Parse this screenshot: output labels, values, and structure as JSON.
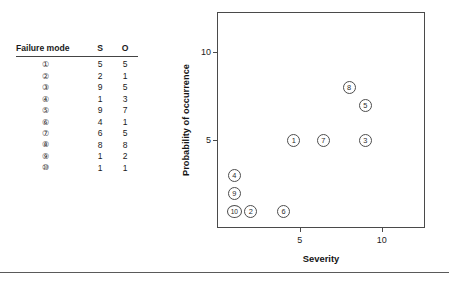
{
  "table": {
    "headers": [
      "Failure mode",
      "S",
      "O"
    ],
    "rows": [
      {
        "mode": "①",
        "s": "5",
        "o": "5"
      },
      {
        "mode": "②",
        "s": "2",
        "o": "1"
      },
      {
        "mode": "③",
        "s": "9",
        "o": "5"
      },
      {
        "mode": "④",
        "s": "1",
        "o": "3"
      },
      {
        "mode": "⑤",
        "s": "9",
        "o": "7"
      },
      {
        "mode": "⑥",
        "s": "4",
        "o": "1"
      },
      {
        "mode": "⑦",
        "s": "6",
        "o": "5"
      },
      {
        "mode": "⑧",
        "s": "8",
        "o": "8"
      },
      {
        "mode": "⑨",
        "s": "1",
        "o": "2"
      },
      {
        "mode": "⑩",
        "s": "1",
        "o": "1"
      }
    ]
  },
  "chart_data": {
    "type": "scatter",
    "title": "",
    "xlabel": "Severity",
    "ylabel": "Probability of occurrence",
    "xlim": [
      0,
      12.7
    ],
    "ylim": [
      0,
      12.2
    ],
    "xticks": [
      5,
      10
    ],
    "xticklabels": [
      "5",
      "10"
    ],
    "yticks": [
      5,
      10
    ],
    "yticklabels": [
      "5",
      "10"
    ],
    "grid": false,
    "legend": false,
    "point_label_style": "circled-number",
    "points": [
      {
        "label": "①",
        "x": 5,
        "y": 5
      },
      {
        "label": "②",
        "x": 2,
        "y": 1
      },
      {
        "label": "③",
        "x": 9,
        "y": 5
      },
      {
        "label": "④",
        "x": 1,
        "y": 3
      },
      {
        "label": "⑤",
        "x": 9,
        "y": 7
      },
      {
        "label": "⑥",
        "x": 4,
        "y": 1
      },
      {
        "label": "⑦",
        "x": 6,
        "y": 5
      },
      {
        "label": "⑧",
        "x": 8,
        "y": 8
      },
      {
        "label": "⑨",
        "x": 1,
        "y": 2
      },
      {
        "label": "⑩",
        "x": 1,
        "y": 1
      }
    ]
  }
}
